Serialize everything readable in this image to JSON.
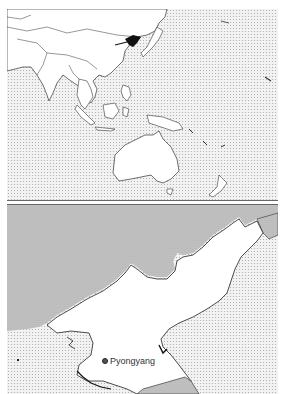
{
  "map": {
    "subject": "North Korea locator map",
    "colors": {
      "sea": "#e8e8e8",
      "neighbor_land": "#cfcfcf",
      "land": "#ffffff",
      "highlight": "#111111",
      "border": "#333333",
      "frame": "#777777"
    },
    "overview_panel": {
      "region": "Asia-Pacific",
      "highlighted_country": "North Korea"
    },
    "detail_panel": {
      "country": "North Korea",
      "cities": [
        {
          "name": "Pyongyang",
          "type": "capital"
        }
      ]
    }
  }
}
